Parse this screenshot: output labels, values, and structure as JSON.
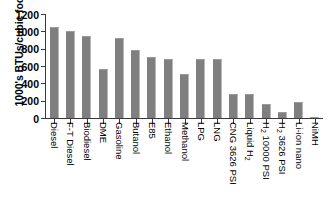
{
  "chart_data": {
    "type": "bar",
    "title": "",
    "xlabel": "",
    "ylabel": "1000's BTUs/cubic foot",
    "ylim": [
      0,
      1200
    ],
    "ytick_values": [
      0,
      200,
      400,
      600,
      800,
      1000,
      1200
    ],
    "ytick_labels": [
      "0",
      "200",
      "400",
      "600",
      "800",
      "1000",
      "1200"
    ],
    "grid": false,
    "legend": null,
    "bar_color": "#7f7f7f",
    "axis_color": "#3a3a3a",
    "categories": [
      "Diesel",
      "F-T Diesel",
      "Biodiesel",
      "DME",
      "Gasoline",
      "Butanol",
      "E85",
      "Ethanol",
      "Methanol",
      "LPG",
      "LNG",
      "CNG 3626 PSI",
      "Liquid H2",
      "H2 10000 PSI",
      "H2 3626 PSI",
      "Li-ion nano",
      "NiMH"
    ],
    "category_labels_html": [
      "Diesel",
      "F-T Diesel",
      "Biodiesel",
      "DME",
      "Gasoline",
      "Butanol",
      "E85",
      "Ethanol",
      "Methanol",
      "LPG",
      "LNG",
      "CNG 3626 PSI",
      "Liquid H<sub>2</sub>",
      "H<sub>2</sub> 10000 PSI",
      "H<sub>2</sub> 3626 PSI",
      "Li-ion nano",
      "NiMH"
    ],
    "values": [
      1050,
      1000,
      950,
      560,
      920,
      790,
      700,
      680,
      505,
      680,
      680,
      275,
      275,
      165,
      70,
      190,
      8
    ]
  }
}
